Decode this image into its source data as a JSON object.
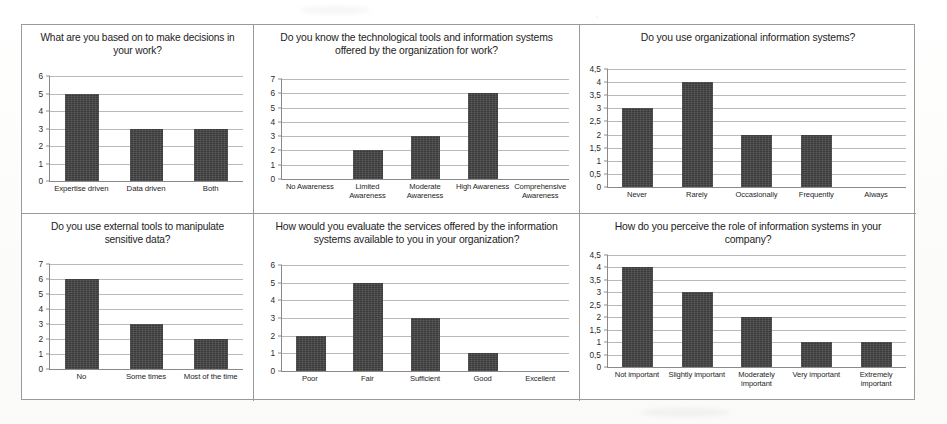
{
  "figure": {
    "bar_color": "#3b3b3b",
    "panel_border_color": "#9a9a9a",
    "gridline_color": "#b9b9b9",
    "decimal_separator": ","
  },
  "chart_data": [
    {
      "id": "decision-basis",
      "type": "bar",
      "title": "What are you based on to make decisions in your work?",
      "categories": [
        "Expertise driven",
        "Data driven",
        "Both"
      ],
      "values": [
        5,
        3,
        3
      ],
      "yticks": [
        "0",
        "1",
        "2",
        "3",
        "4",
        "5",
        "6"
      ],
      "ylim": [
        0,
        6
      ],
      "xlabel": "",
      "ylabel": "",
      "grid": true,
      "legend": "none"
    },
    {
      "id": "tool-awareness",
      "type": "bar",
      "title": "Do you know the technological tools and information systems offered by the organization for work?",
      "categories": [
        "No Awareness",
        "Limited Awareness",
        "Moderate Awareness",
        "High Awareness",
        "Comprehensive Awareness"
      ],
      "values": [
        0,
        2,
        3,
        6,
        0
      ],
      "yticks": [
        "0",
        "1",
        "2",
        "3",
        "4",
        "5",
        "6",
        "7"
      ],
      "ylim": [
        0,
        7
      ],
      "xlabel": "",
      "ylabel": "",
      "grid": true,
      "legend": "none"
    },
    {
      "id": "system-usage",
      "type": "bar",
      "title": "Do you use organizational information systems?",
      "categories": [
        "Never",
        "Rarely",
        "Occasionally",
        "Frequently",
        "Always"
      ],
      "values": [
        3,
        4,
        2,
        2,
        0
      ],
      "yticks": [
        "0",
        "0,5",
        "1",
        "1,5",
        "2",
        "2,5",
        "3",
        "3,5",
        "4",
        "4,5"
      ],
      "ylim": [
        0,
        4.5
      ],
      "xlabel": "",
      "ylabel": "",
      "grid": true,
      "legend": "none"
    },
    {
      "id": "external-tools",
      "type": "bar",
      "title": "Do you use external tools to manipulate sensitive data?",
      "categories": [
        "No",
        "Some times",
        "Most of the time"
      ],
      "values": [
        6,
        3,
        2
      ],
      "yticks": [
        "0",
        "1",
        "2",
        "3",
        "4",
        "5",
        "6",
        "7"
      ],
      "ylim": [
        0,
        7
      ],
      "xlabel": "",
      "ylabel": "",
      "grid": true,
      "legend": "none"
    },
    {
      "id": "service-evaluation",
      "type": "bar",
      "title": "How would you evaluate the services offered by the information systems available to you in your organization?",
      "categories": [
        "Poor",
        "Fair",
        "Sufficient",
        "Good",
        "Excellent"
      ],
      "values": [
        2,
        5,
        3,
        1,
        0
      ],
      "yticks": [
        "0",
        "1",
        "2",
        "3",
        "4",
        "5",
        "6"
      ],
      "ylim": [
        0,
        6
      ],
      "xlabel": "",
      "ylabel": "",
      "grid": true,
      "legend": "none"
    },
    {
      "id": "perceived-role",
      "type": "bar",
      "title": "How do you perceive the role of information systems in your company?",
      "categories": [
        "Not important",
        "Slightly important",
        "Moderately important",
        "Very important",
        "Extremely important"
      ],
      "values": [
        4,
        3,
        2,
        1,
        1
      ],
      "yticks": [
        "0",
        "0,5",
        "1",
        "1,5",
        "2",
        "2,5",
        "3",
        "3,5",
        "4",
        "4,5"
      ],
      "ylim": [
        0,
        4.5
      ],
      "xlabel": "",
      "ylabel": "",
      "grid": true,
      "legend": "none"
    }
  ]
}
